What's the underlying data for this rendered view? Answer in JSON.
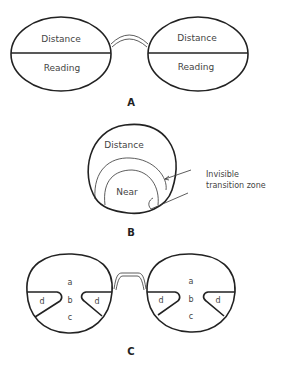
{
  "panel_a": {
    "caption": "A",
    "left_lens": {
      "top": "Distance",
      "bottom": "Reading"
    },
    "right_lens": {
      "top": "Distance",
      "bottom": "Reading"
    }
  },
  "panel_b": {
    "caption": "B",
    "top_label": "Distance",
    "inner_label": "Near",
    "annotation_line1": "Invisible",
    "annotation_line2": "transition zone"
  },
  "panel_c": {
    "caption": "C",
    "left_lens": {
      "a": "a",
      "b": "b",
      "c": "c",
      "d_left": "d",
      "d_right": "d"
    },
    "right_lens": {
      "a": "a",
      "b": "b",
      "c": "c",
      "d_left": "d",
      "d_right": "d"
    }
  },
  "colors": {
    "line": "#222222",
    "text": "#444444",
    "background": "#ffffff"
  }
}
